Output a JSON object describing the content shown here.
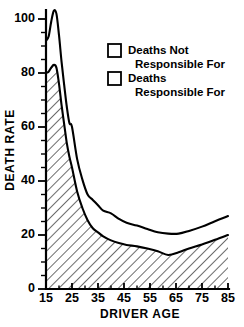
{
  "chart_data": {
    "type": "area",
    "title": "",
    "subtitle": "",
    "xlabel": "DRIVER AGE",
    "ylabel": "DEATH RATE",
    "xlim": [
      15,
      85
    ],
    "ylim": [
      0,
      105
    ],
    "grid": false,
    "stacked": true,
    "legend_position": "upper-center-right",
    "x_ticks_major": [
      15,
      25,
      35,
      45,
      55,
      65,
      75,
      85
    ],
    "x_ticks_minor": [
      20,
      30,
      40,
      50,
      60,
      70,
      80
    ],
    "y_ticks_major": [
      0,
      20,
      40,
      60,
      80,
      100
    ],
    "y_ticks_minor": [
      5,
      10,
      15,
      25,
      30,
      35,
      45,
      50,
      55,
      65,
      70,
      75,
      85,
      90,
      95
    ],
    "x_tick_labels": [
      "15",
      "25",
      "35",
      "45",
      "55",
      "65",
      "75",
      "85"
    ],
    "y_tick_labels": [
      "0",
      "20",
      "40",
      "60",
      "80",
      "100"
    ],
    "x": [
      15,
      16,
      17,
      18,
      19,
      20,
      21,
      22,
      23,
      24,
      25,
      27,
      29,
      31,
      33,
      35,
      37,
      40,
      43,
      46,
      50,
      54,
      58,
      62,
      66,
      70,
      75,
      80,
      85
    ],
    "series": [
      {
        "name": "Deaths Responsible For",
        "fill": "hatched",
        "values": [
          80,
          80.5,
          82,
          83,
          82,
          76,
          68,
          61,
          54,
          49,
          45,
          36,
          30,
          25.5,
          22.5,
          21,
          19.5,
          18,
          17,
          16.3,
          15.8,
          15,
          14,
          12.6,
          13.6,
          15,
          16.5,
          18.2,
          20
        ]
      },
      {
        "name": "Deaths Not Responsible For",
        "fill": "white",
        "values": [
          12,
          13,
          17,
          20,
          20,
          18,
          16,
          14.5,
          13.5,
          12.5,
          15,
          12,
          10.5,
          9.5,
          10.5,
          10,
          9.5,
          10,
          9,
          8.2,
          7.7,
          7.2,
          7,
          7.9,
          6.9,
          6.5,
          6.6,
          6.9,
          7
        ]
      }
    ],
    "series_total": {
      "name": "Total (upper boundary)",
      "values": [
        92,
        93.5,
        99,
        103,
        102,
        94,
        84,
        75.5,
        67.5,
        61.5,
        60,
        48,
        40.5,
        35,
        33,
        31,
        29,
        28,
        26,
        24.5,
        23.5,
        22.2,
        21,
        20.5,
        20.5,
        21.5,
        23.1,
        25.1,
        27
      ]
    }
  },
  "legend": {
    "items": [
      {
        "label_line1": "Deaths Not",
        "label_line2": "Responsible For",
        "swatch": "empty-box"
      },
      {
        "label_line1": "Deaths",
        "label_line2": "Responsible For",
        "swatch": "hatched-box"
      }
    ]
  },
  "axes": {
    "y_title": "DEATH RATE",
    "x_title": "DRIVER AGE"
  },
  "colors": {
    "ink": "#000000",
    "paper": "#ffffff"
  }
}
